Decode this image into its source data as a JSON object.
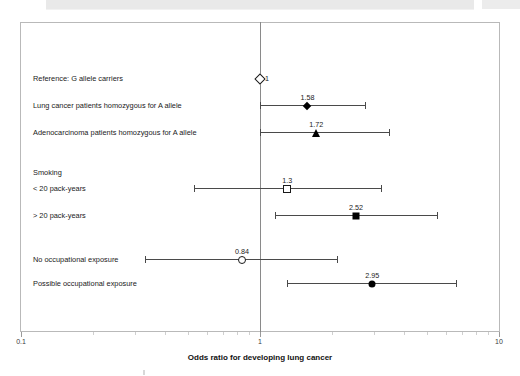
{
  "header": {
    "cut_off_strip_text": "",
    "present": true
  },
  "chart_data": {
    "type": "scatter",
    "subtype": "forest-plot",
    "title": "",
    "xlabel": "Odds ratio for developing lung cancer",
    "ylabel": "",
    "xscale": "log",
    "xlim": [
      0.1,
      10
    ],
    "grid": false,
    "legend": "none",
    "reference_line": 1,
    "xticks": [
      {
        "value": 0.1,
        "label": "0.1",
        "type": "major"
      },
      {
        "value": 1,
        "label": "1",
        "type": "major"
      },
      {
        "value": 10,
        "label": "10",
        "type": "major"
      }
    ],
    "minor_ticks": [
      0.2,
      0.3,
      0.4,
      0.5,
      0.6,
      0.7,
      0.8,
      0.9,
      2,
      3,
      4,
      5,
      6,
      7,
      8,
      9
    ],
    "rows": [
      {
        "label": "Reference: G allele carriers",
        "estimate": 1,
        "estimate_label": "1",
        "ci_low": null,
        "ci_high": null,
        "marker": "diamond-open",
        "label_side": "right"
      },
      {
        "label": "Lung cancer patients homozygous for A allele",
        "estimate": 1.58,
        "estimate_label": "1.58",
        "ci_low": 1.0,
        "ci_high": 2.75,
        "marker": "diamond-filled",
        "label_side": "above"
      },
      {
        "label": "Adenocarcinoma patients homozygous for A allele",
        "estimate": 1.72,
        "estimate_label": "1.72",
        "ci_low": 1.0,
        "ci_high": 3.45,
        "marker": "triangle-filled",
        "label_side": "above"
      },
      {
        "label": "Smoking",
        "estimate": null,
        "estimate_label": "",
        "ci_low": null,
        "ci_high": null,
        "marker": "none",
        "label_side": "none",
        "is_group_heading": true
      },
      {
        "label": "< 20 pack-years",
        "estimate": 1.3,
        "estimate_label": "1.3",
        "ci_low": 0.53,
        "ci_high": 3.2,
        "marker": "square-open",
        "label_side": "above"
      },
      {
        "label": "> 20 pack-years",
        "estimate": 2.52,
        "estimate_label": "2.52",
        "ci_low": 1.15,
        "ci_high": 5.5,
        "marker": "square-filled",
        "label_side": "above"
      },
      {
        "label": "No occupational exposure",
        "estimate": 0.84,
        "estimate_label": "0.84",
        "ci_low": 0.33,
        "ci_high": 2.1,
        "marker": "circle-open",
        "label_side": "above"
      },
      {
        "label": "Possible occupational exposure",
        "estimate": 2.95,
        "estimate_label": "2.95",
        "ci_low": 1.3,
        "ci_high": 6.6,
        "marker": "circle-filled",
        "label_side": "above"
      }
    ]
  }
}
